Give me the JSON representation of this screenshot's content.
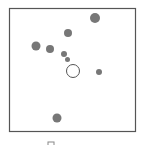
{
  "chart_data": {
    "type": "scatter",
    "title": "",
    "xlabel": "",
    "ylabel": "",
    "grid": false,
    "frame": {
      "x": 9.5,
      "y": 8.5,
      "width": 126,
      "height": 123,
      "stroke": "#555555"
    },
    "filled_color": "#777777",
    "open_color": "#555555",
    "points": [
      {
        "cx": 95,
        "cy": 18,
        "r": 5,
        "filled": true
      },
      {
        "cx": 68,
        "cy": 33,
        "r": 4,
        "filled": true
      },
      {
        "cx": 36,
        "cy": 46,
        "r": 4.5,
        "filled": true
      },
      {
        "cx": 50,
        "cy": 49,
        "r": 4,
        "filled": true
      },
      {
        "cx": 64,
        "cy": 54,
        "r": 3,
        "filled": true
      },
      {
        "cx": 67.5,
        "cy": 59.5,
        "r": 2.5,
        "filled": true
      },
      {
        "cx": 73,
        "cy": 71,
        "r": 6.5,
        "filled": false
      },
      {
        "cx": 99,
        "cy": 72,
        "r": 3,
        "filled": true
      },
      {
        "cx": 57,
        "cy": 118,
        "r": 4.5,
        "filled": true
      }
    ],
    "legend": {
      "swatch": {
        "x": 48,
        "y": 142,
        "width": 6,
        "height": 6,
        "stroke": "#888888"
      }
    }
  }
}
